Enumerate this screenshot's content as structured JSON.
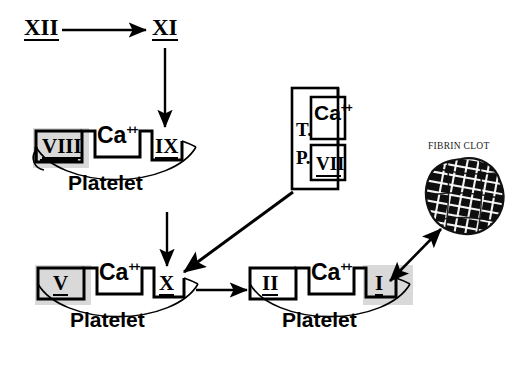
{
  "diagram": {
    "background_color": "#ffffff",
    "ink_color": "#000000",
    "highlight_color": "#d9d9d9"
  },
  "top_row": {
    "factor_xii": "XII",
    "factor_xi": "XI"
  },
  "platelet_top": {
    "name": "Platelet",
    "label": "Platelet",
    "receptors": [
      {
        "id": "viii",
        "label": "VIII",
        "highlighted": true
      },
      {
        "id": "ca",
        "label": "Ca",
        "superscript": "++",
        "highlighted": false
      },
      {
        "id": "ix",
        "label": "IX",
        "highlighted": false
      }
    ]
  },
  "platelet_bottom_left": {
    "name": "Platelet",
    "label": "Platelet",
    "receptors": [
      {
        "id": "v",
        "label": "V",
        "highlighted": true
      },
      {
        "id": "ca",
        "label": "Ca",
        "superscript": "++",
        "highlighted": false
      },
      {
        "id": "x",
        "label": "X",
        "highlighted": false
      }
    ]
  },
  "platelet_bottom_right": {
    "name": "Platelet",
    "label": "Platelet",
    "receptors": [
      {
        "id": "ii",
        "label": "II",
        "highlighted": false
      },
      {
        "id": "ca",
        "label": "Ca",
        "superscript": "++",
        "highlighted": false
      },
      {
        "id": "i",
        "label": "I",
        "highlighted": true
      }
    ]
  },
  "tissue_factor_box": {
    "name": "Tissue Phospholipid complex",
    "left_label_line1": "T.",
    "left_label_line2": "P.",
    "slot_top": "Ca",
    "slot_top_superscript": "++",
    "slot_bottom": "VII"
  },
  "fibrin_clot": {
    "label": "FIBRIN CLOT"
  },
  "arrows": [
    {
      "id": "xii-to-xi",
      "from": "XII",
      "to": "XI",
      "style": "single"
    },
    {
      "id": "xi-to-ix",
      "from": "XI",
      "to": "IX",
      "style": "single"
    },
    {
      "id": "platelet-top-to-x",
      "from": "Platelet (VIII/Ca/IX)",
      "to": "X",
      "style": "single"
    },
    {
      "id": "tp-to-x",
      "from": "T.P. complex",
      "to": "X",
      "style": "single"
    },
    {
      "id": "x-to-ii",
      "from": "X",
      "to": "II",
      "style": "single"
    },
    {
      "id": "i-to-clot",
      "from": "I",
      "to": "FIBRIN CLOT",
      "style": "double"
    }
  ]
}
